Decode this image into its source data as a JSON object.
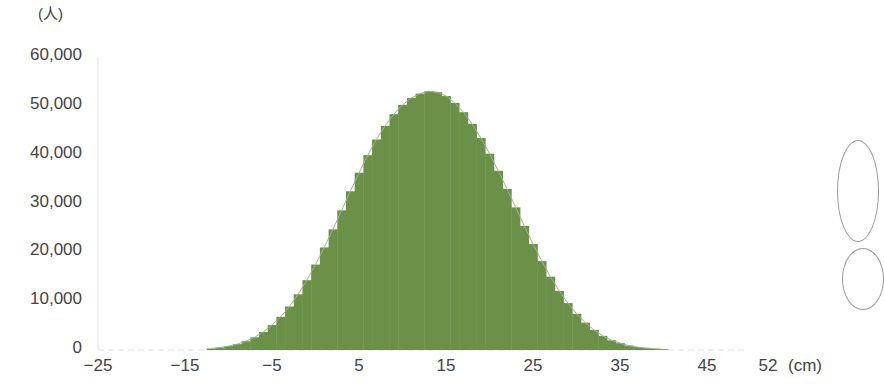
{
  "chart_data": {
    "type": "bar",
    "title": "",
    "ylabel": "(人)",
    "xlabel": "(cm)",
    "ylim": [
      0,
      60000
    ],
    "xlim": [
      -25,
      52
    ],
    "yticks": [
      "0",
      "10,000",
      "20,000",
      "30,000",
      "40,000",
      "50,000",
      "60,000"
    ],
    "xticks": [
      "−25",
      "−15",
      "−5",
      "5",
      "15",
      "25",
      "35",
      "45",
      "52"
    ],
    "grid": false,
    "legend": null,
    "bar_color": "#6b9148",
    "categories": [
      -12,
      -11,
      -10,
      -9,
      -8,
      -7,
      -6,
      -5,
      -4,
      -3,
      -2,
      -1,
      0,
      1,
      2,
      3,
      4,
      5,
      6,
      7,
      8,
      9,
      10,
      11,
      12,
      13,
      14,
      15,
      16,
      17,
      18,
      19,
      20,
      21,
      22,
      23,
      24,
      25,
      26,
      27,
      28,
      29,
      30,
      31,
      32,
      33,
      34,
      35,
      36,
      37,
      38,
      39,
      40
    ],
    "values": [
      300,
      500,
      800,
      1200,
      1800,
      2600,
      3700,
      5100,
      6800,
      8900,
      11400,
      14300,
      17500,
      21000,
      24700,
      28600,
      32500,
      36300,
      39900,
      43100,
      45900,
      48300,
      50200,
      51600,
      52500,
      53000,
      52800,
      52000,
      50600,
      48700,
      46300,
      43400,
      40200,
      36700,
      33000,
      29200,
      25400,
      21700,
      18200,
      15000,
      12100,
      9600,
      7400,
      5600,
      4100,
      2900,
      2000,
      1400,
      900,
      600,
      400,
      250,
      150
    ]
  },
  "labels": {
    "y_unit": "(人)",
    "x_unit": "(cm)"
  }
}
